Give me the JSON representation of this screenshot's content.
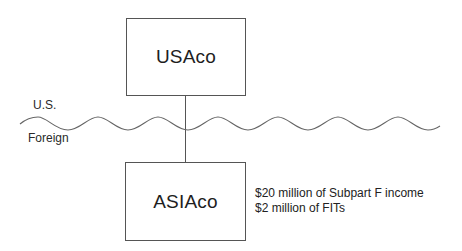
{
  "diagram": {
    "entities": {
      "parent": {
        "label": "USAco"
      },
      "subsidiary": {
        "label": "ASIAco"
      }
    },
    "regions": {
      "upper": "U.S.",
      "lower": "Foreign"
    },
    "annotation": {
      "lines": [
        "$20 million of Subpart F income",
        "$2 million of FITs"
      ]
    },
    "colors": {
      "line": "#555555",
      "wave": "#666666",
      "text": "#222222",
      "background": "#ffffff"
    }
  }
}
